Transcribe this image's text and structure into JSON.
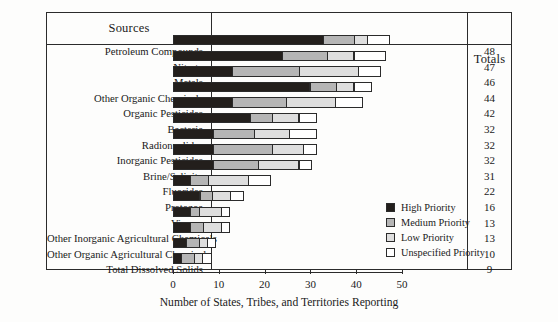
{
  "table": {
    "sources_header": "Sources",
    "totals_header": "Totals"
  },
  "axis": {
    "xlabel": "Number of States, Tribes, and Territories Reporting",
    "ticks": [
      "0",
      "10",
      "20",
      "30",
      "40",
      "50"
    ]
  },
  "legend": {
    "title": "",
    "items": [
      {
        "label": "High Priority",
        "color": "#231f1c"
      },
      {
        "label": "Medium Priority",
        "color": "#b5b5b5"
      },
      {
        "label": "Low Priority",
        "color": "#dedede"
      },
      {
        "label": "Unspecified Priority",
        "color": "#ffffff"
      }
    ]
  },
  "chart_data": {
    "type": "bar",
    "orientation": "horizontal",
    "stacked": true,
    "title": "",
    "xlabel": "Number of States, Tribes, and Territories Reporting",
    "ylabel": "Sources",
    "xlim": [
      0,
      50
    ],
    "xticks": [
      0,
      10,
      20,
      30,
      40,
      50
    ],
    "grid": false,
    "legend_position": "inside-right",
    "categories": [
      "Petroleum Compounds",
      "Nitrate",
      "Metals",
      "Other Organic Chemicals",
      "Organic Pesticides",
      "Bacteria",
      "Radionuclides",
      "Inorganic Pesticides",
      "Brine/Salinity",
      "Fluorides",
      "Protozoa",
      "Viruses",
      "Other Inorganic Agricultural Chemicals",
      "Other Organic Agricultural Chemicals",
      "Total Dissolved Solids"
    ],
    "series": [
      {
        "name": "High Priority",
        "values": [
          33,
          24,
          13,
          30,
          13,
          17,
          9,
          9,
          9,
          4,
          6,
          4,
          4,
          3,
          2
        ]
      },
      {
        "name": "Medium Priority",
        "values": [
          7,
          10,
          15,
          6,
          12,
          10,
          9,
          7,
          5,
          4,
          3,
          2,
          3,
          3,
          3
        ]
      },
      {
        "name": "Low Priority",
        "values": [
          3,
          6,
          13,
          4,
          11,
          9,
          8,
          9,
          9,
          9,
          4,
          5,
          4,
          2,
          2
        ]
      },
      {
        "name": "Unspecified Priority",
        "values": [
          5,
          7,
          5,
          4,
          6,
          6,
          6,
          7,
          8,
          5,
          3,
          2,
          2,
          2,
          2
        ]
      }
    ],
    "totals": [
      48,
      47,
      46,
      44,
      42,
      32,
      32,
      31,
      22,
      16,
      13,
      13,
      10,
      9
    ]
  },
  "rows": [
    {
      "label": "Petroleum Compounds",
      "total": "48",
      "segments": [
        33,
        7,
        3,
        5
      ]
    },
    {
      "label": "Nitrate",
      "total": "47",
      "segments": [
        24,
        10,
        6,
        7
      ]
    },
    {
      "label": "Metals",
      "total": "46",
      "segments": [
        13,
        15,
        13,
        5
      ]
    },
    {
      "label": "Other Organic Chemicals",
      "total": "44",
      "segments": [
        30,
        6,
        4,
        4
      ]
    },
    {
      "label": "Organic Pesticides",
      "total": "42",
      "segments": [
        13,
        12,
        11,
        6
      ]
    },
    {
      "label": "Bacteria",
      "total": "32",
      "segments": [
        17,
        5,
        6,
        4
      ]
    },
    {
      "label": "Radionuclides",
      "total": "32",
      "segments": [
        9,
        9,
        8,
        6
      ]
    },
    {
      "label": "Inorganic Pesticides",
      "total": "32",
      "segments": [
        9,
        13,
        7,
        3
      ]
    },
    {
      "label": "Brine/Salinity",
      "total": "31",
      "segments": [
        9,
        10,
        9,
        3
      ]
    },
    {
      "label": "Fluorides",
      "total": "22",
      "segments": [
        4,
        4,
        9,
        5
      ]
    },
    {
      "label": "Protozoa",
      "total": "16",
      "segments": [
        6,
        3,
        4,
        3
      ]
    },
    {
      "label": "Viruses",
      "total": "13",
      "segments": [
        4,
        2,
        5,
        2
      ]
    },
    {
      "label": "Other Inorganic Agricultural Chemicals",
      "total": "13",
      "segments": [
        4,
        3,
        4,
        2
      ]
    },
    {
      "label": "Other Organic Agricultural Chemicals",
      "total": "10",
      "segments": [
        3,
        3,
        2,
        2
      ]
    },
    {
      "label": "Total Dissolved Solids",
      "total": "9",
      "segments": [
        2,
        3,
        2,
        2
      ]
    }
  ]
}
